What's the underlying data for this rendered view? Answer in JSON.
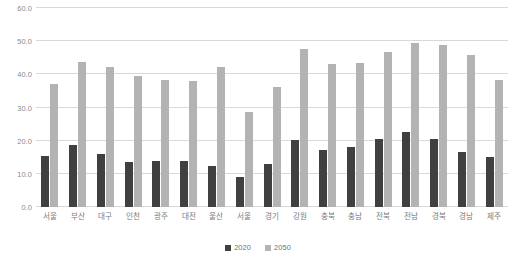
{
  "chart_data": {
    "type": "bar",
    "title": "",
    "subtitle": "",
    "xlabel": "",
    "ylabel": "",
    "ylim": [
      0,
      60
    ],
    "ytick_step": 10,
    "ytick_labels": [
      "0.0",
      "10.0",
      "20.0",
      "30.0",
      "40.0",
      "50.0",
      "60.0"
    ],
    "ytick_values": [
      0,
      10,
      20,
      30,
      40,
      50,
      60
    ],
    "grid": true,
    "legend_position": "bottom-center",
    "categories": [
      "서울",
      "부산",
      "대구",
      "인천",
      "광주",
      "대전",
      "울산",
      "서울",
      "경기",
      "강원",
      "충북",
      "충남",
      "전북",
      "전남",
      "경북",
      "경남",
      "제주"
    ],
    "series": [
      {
        "name": "2020",
        "color": "#404040",
        "values": [
          15.4,
          18.6,
          15.9,
          13.6,
          13.9,
          13.9,
          12.3,
          9.2,
          12.9,
          20.1,
          17.1,
          18.0,
          20.5,
          22.6,
          20.5,
          16.6,
          15.2
        ]
      },
      {
        "name": "2050",
        "color": "#b3b3b3",
        "values": [
          37.0,
          43.6,
          42.2,
          39.5,
          38.2,
          37.9,
          42.2,
          28.5,
          36.1,
          47.7,
          43.0,
          43.3,
          46.8,
          49.5,
          48.9,
          45.9,
          38.2
        ]
      }
    ]
  },
  "legend": {
    "items": [
      {
        "label": "2020",
        "swatch": "series-a"
      },
      {
        "label": "2050",
        "swatch": "series-b"
      }
    ]
  }
}
